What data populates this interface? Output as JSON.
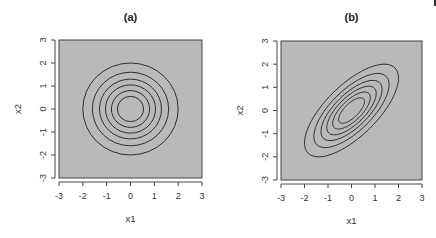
{
  "colors": {
    "panel_fill": "#b9b9b9",
    "contour": "#2e2e2e",
    "axis": "#444444",
    "background": "#ffffff"
  },
  "chart_data": [
    {
      "type": "contour",
      "title": "(a)",
      "xlabel": "x1",
      "ylabel": "x2",
      "xlim": [
        -3,
        3
      ],
      "ylim": [
        -3,
        3
      ],
      "xticks": [
        "-3",
        "-2",
        "-1",
        "0",
        "1",
        "2",
        "3"
      ],
      "yticks": [
        "-3",
        "-2",
        "-1",
        "0",
        "1",
        "2",
        "3"
      ],
      "grid": false,
      "legend": null,
      "description": "Bivariate normal density contours, independent components (correlation 0) - concentric circles centered at (0,0)",
      "center": [
        0,
        0
      ],
      "correlation": 0.0,
      "contour_radii": [
        2.0,
        1.6,
        1.3,
        1.05,
        0.8,
        0.55
      ]
    },
    {
      "type": "contour",
      "title": "(b)",
      "xlabel": "x1",
      "ylabel": "x2",
      "xlim": [
        -3,
        3
      ],
      "ylim": [
        -3,
        3
      ],
      "xticks": [
        "-3",
        "-2",
        "-1",
        "0",
        "1",
        "2",
        "3"
      ],
      "yticks": [
        "-3",
        "-2",
        "-1",
        "0",
        "1",
        "2",
        "3"
      ],
      "grid": false,
      "legend": null,
      "description": "Bivariate normal density contours, positively correlated components - ellipses tilted at 45 degrees centered at (0,0)",
      "center": [
        0,
        0
      ],
      "correlation": 0.7,
      "contour_levels_extent": [
        2.0,
        1.6,
        1.3,
        1.05,
        0.8,
        0.55
      ]
    }
  ]
}
